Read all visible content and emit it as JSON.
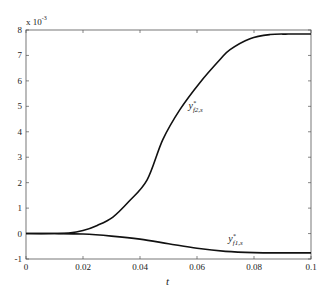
{
  "chart_data": {
    "type": "line",
    "title": "",
    "xlabel": "t",
    "ylabel": "",
    "y_multiplier": "x 10",
    "y_exponent": "-3",
    "xlim": [
      0,
      0.1
    ],
    "ylim": [
      -1,
      8
    ],
    "grid": false,
    "legend": "none (inline curve labels)",
    "x_ticks": [
      "0",
      "0.02",
      "0.04",
      "0.06",
      "0.08",
      "0.1"
    ],
    "y_ticks": [
      "-1",
      "0",
      "1",
      "2",
      "3",
      "4",
      "5",
      "6",
      "7",
      "8"
    ],
    "series": [
      {
        "name": "y*_{f2,s}",
        "label_main": "y",
        "label_sup": "*",
        "label_sub": "f2,s",
        "x": [
          0,
          0.01,
          0.015,
          0.02,
          0.025,
          0.0305,
          0.036,
          0.0425,
          0.048,
          0.054,
          0.061,
          0.068,
          0.0716,
          0.0786,
          0.0856,
          0.092,
          0.1
        ],
        "values": [
          0,
          0,
          0.02,
          0.12,
          0.32,
          0.65,
          1.25,
          2.11,
          3.69,
          4.87,
          5.93,
          6.83,
          7.23,
          7.66,
          7.82,
          7.84,
          7.84
        ]
      },
      {
        "name": "y*_{f1,s}",
        "label_main": "y",
        "label_sup": "*",
        "label_sub": "f1,s",
        "x": [
          0,
          0.01,
          0.02,
          0.03,
          0.04,
          0.05,
          0.06,
          0.07,
          0.08,
          0.09,
          0.1
        ],
        "values": [
          0,
          0,
          -0.02,
          -0.1,
          -0.22,
          -0.4,
          -0.58,
          -0.7,
          -0.75,
          -0.76,
          -0.76
        ]
      }
    ],
    "annotations": [
      {
        "text": "y*_{f2,s}",
        "x": 0.057,
        "y": 4.9
      },
      {
        "text": "y*_{f1,s}",
        "x": 0.071,
        "y": -0.35
      }
    ]
  }
}
